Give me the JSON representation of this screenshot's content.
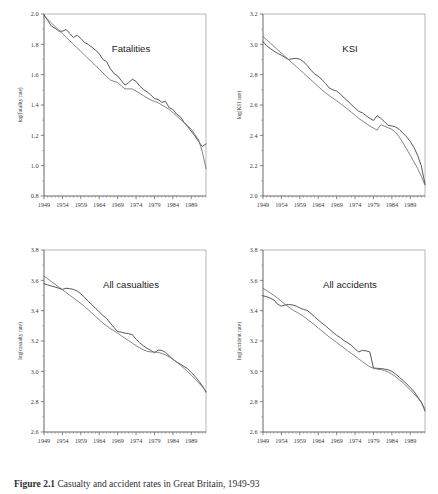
{
  "figure": {
    "caption_label": "Figure",
    "caption_number": "2.1",
    "caption_text": "Casualty and accident rates in Great Britain, 1949-93"
  },
  "chart_data": [
    {
      "type": "line",
      "title": "Fatalities",
      "xlabel": "",
      "ylabel": "log(fatality rate)",
      "xlim": [
        1949,
        1993
      ],
      "ylim": [
        0.8,
        2.0
      ],
      "xticks": [
        1949,
        1954,
        1959,
        1964,
        1969,
        1974,
        1979,
        1984,
        1989
      ],
      "yticks": [
        0.8,
        1.0,
        1.2,
        1.4,
        1.6,
        1.8,
        2.0
      ],
      "grid": false,
      "legend": "none",
      "x": [
        1949,
        1950,
        1951,
        1952,
        1953,
        1954,
        1955,
        1956,
        1957,
        1958,
        1959,
        1960,
        1961,
        1962,
        1963,
        1964,
        1965,
        1966,
        1967,
        1968,
        1969,
        1970,
        1971,
        1972,
        1973,
        1974,
        1975,
        1976,
        1977,
        1978,
        1979,
        1980,
        1981,
        1982,
        1983,
        1984,
        1985,
        1986,
        1987,
        1988,
        1989,
        1990,
        1991,
        1992,
        1993
      ],
      "series": [
        {
          "name": "observed",
          "values": [
            1.995,
            1.958,
            1.92,
            1.906,
            1.888,
            1.886,
            1.898,
            1.872,
            1.845,
            1.86,
            1.839,
            1.812,
            1.8,
            1.781,
            1.762,
            1.738,
            1.7,
            1.686,
            1.64,
            1.608,
            1.592,
            1.561,
            1.531,
            1.548,
            1.57,
            1.556,
            1.525,
            1.502,
            1.487,
            1.466,
            1.443,
            1.436,
            1.418,
            1.424,
            1.382,
            1.371,
            1.34,
            1.323,
            1.287,
            1.258,
            1.227,
            1.196,
            1.158,
            1.127,
            1.143,
            1.104,
            1.058,
            1.022,
            0.975
          ]
        },
        {
          "name": "fitted-trend",
          "values": [
            1.988,
            1.965,
            1.941,
            1.918,
            1.894,
            1.871,
            1.847,
            1.824,
            1.8,
            1.777,
            1.753,
            1.73,
            1.706,
            1.683,
            1.659,
            1.636,
            1.612,
            1.589,
            1.565,
            1.556,
            1.548,
            1.527,
            1.506,
            1.506,
            1.506,
            1.492,
            1.477,
            1.462,
            1.447,
            1.433,
            1.424,
            1.415,
            1.4,
            1.386,
            1.371,
            1.35,
            1.328,
            1.306,
            1.285,
            1.263,
            1.241,
            1.206,
            1.17,
            1.092,
            0.98
          ]
        }
      ]
    },
    {
      "type": "line",
      "title": "KSI",
      "xlabel": "",
      "ylabel": "log(KSI rate)",
      "xlim": [
        1949,
        1993
      ],
      "ylim": [
        2.0,
        3.2
      ],
      "xticks": [
        1949,
        1954,
        1959,
        1964,
        1969,
        1974,
        1979,
        1984,
        1989
      ],
      "yticks": [
        2.0,
        2.2,
        2.4,
        2.6,
        2.8,
        3.0,
        3.2
      ],
      "grid": false,
      "legend": "none",
      "x": [
        1949,
        1950,
        1951,
        1952,
        1953,
        1954,
        1955,
        1956,
        1957,
        1958,
        1959,
        1960,
        1961,
        1962,
        1963,
        1964,
        1965,
        1966,
        1967,
        1968,
        1969,
        1970,
        1971,
        1972,
        1973,
        1974,
        1975,
        1976,
        1977,
        1978,
        1979,
        1980,
        1981,
        1982,
        1983,
        1984,
        1985,
        1986,
        1987,
        1988,
        1989,
        1990,
        1991,
        1992,
        1993
      ],
      "series": [
        {
          "name": "observed",
          "values": [
            3.018,
            2.99,
            2.972,
            2.955,
            2.94,
            2.928,
            2.913,
            2.9,
            2.905,
            2.908,
            2.902,
            2.885,
            2.86,
            2.83,
            2.805,
            2.79,
            2.768,
            2.742,
            2.712,
            2.7,
            2.692,
            2.672,
            2.648,
            2.626,
            2.602,
            2.58,
            2.558,
            2.548,
            2.53,
            2.512,
            2.498,
            2.53,
            2.512,
            2.49,
            2.465,
            2.462,
            2.455,
            2.44,
            2.415,
            2.39,
            2.36,
            2.32,
            2.268,
            2.198,
            2.078
          ]
        },
        {
          "name": "fitted-trend",
          "values": [
            3.052,
            3.03,
            3.008,
            2.986,
            2.964,
            2.942,
            2.92,
            2.898,
            2.876,
            2.854,
            2.832,
            2.81,
            2.788,
            2.766,
            2.744,
            2.722,
            2.7,
            2.68,
            2.662,
            2.645,
            2.628,
            2.61,
            2.592,
            2.572,
            2.552,
            2.532,
            2.512,
            2.495,
            2.478,
            2.462,
            2.448,
            2.434,
            2.47,
            2.46,
            2.45,
            2.44,
            2.42,
            2.39,
            2.352,
            2.31,
            2.268,
            2.225,
            2.182,
            2.13,
            2.072
          ]
        }
      ]
    },
    {
      "type": "line",
      "title": "All casualties",
      "xlabel": "",
      "ylabel": "log(casualty rate)",
      "xlim": [
        1949,
        1993
      ],
      "ylim": [
        2.6,
        3.8
      ],
      "xticks": [
        1949,
        1954,
        1959,
        1964,
        1969,
        1974,
        1979,
        1984,
        1989
      ],
      "yticks": [
        2.6,
        2.8,
        3.0,
        3.2,
        3.4,
        3.6,
        3.8
      ],
      "grid": false,
      "legend": "none",
      "x": [
        1949,
        1950,
        1951,
        1952,
        1953,
        1954,
        1955,
        1956,
        1957,
        1958,
        1959,
        1960,
        1961,
        1962,
        1963,
        1964,
        1965,
        1966,
        1967,
        1968,
        1969,
        1970,
        1971,
        1972,
        1973,
        1974,
        1975,
        1976,
        1977,
        1978,
        1979,
        1980,
        1981,
        1982,
        1983,
        1984,
        1985,
        1986,
        1987,
        1988,
        1989,
        1990,
        1991,
        1992,
        1993
      ],
      "series": [
        {
          "name": "observed",
          "values": [
            3.578,
            3.57,
            3.562,
            3.556,
            3.548,
            3.54,
            3.548,
            3.545,
            3.54,
            3.53,
            3.512,
            3.488,
            3.462,
            3.44,
            3.415,
            3.392,
            3.368,
            3.348,
            3.318,
            3.29,
            3.262,
            3.258,
            3.252,
            3.248,
            3.242,
            3.212,
            3.188,
            3.168,
            3.152,
            3.138,
            3.122,
            3.14,
            3.138,
            3.125,
            3.102,
            3.08,
            3.062,
            3.048,
            3.032,
            3.018,
            2.992,
            2.968,
            2.938,
            2.905,
            2.862
          ]
        },
        {
          "name": "fitted-trend",
          "values": [
            3.628,
            3.61,
            3.592,
            3.574,
            3.556,
            3.538,
            3.52,
            3.502,
            3.484,
            3.466,
            3.448,
            3.428,
            3.406,
            3.384,
            3.362,
            3.34,
            3.318,
            3.3,
            3.282,
            3.268,
            3.252,
            3.235,
            3.218,
            3.202,
            3.186,
            3.17,
            3.155,
            3.142,
            3.132,
            3.128,
            3.128,
            3.125,
            3.118,
            3.108,
            3.095,
            3.08,
            3.062,
            3.042,
            3.02,
            2.998,
            2.975,
            2.95,
            2.925,
            2.898,
            2.868
          ]
        }
      ]
    },
    {
      "type": "line",
      "title": "All accidents",
      "xlabel": "",
      "ylabel": "log(accident rate)",
      "xlim": [
        1949,
        1993
      ],
      "ylim": [
        2.6,
        3.8
      ],
      "xticks": [
        1949,
        1954,
        1959,
        1964,
        1969,
        1974,
        1979,
        1984,
        1989
      ],
      "yticks": [
        2.6,
        2.8,
        3.0,
        3.2,
        3.4,
        3.6,
        3.8
      ],
      "grid": false,
      "legend": "none",
      "x": [
        1949,
        1950,
        1951,
        1952,
        1953,
        1954,
        1955,
        1956,
        1957,
        1958,
        1959,
        1960,
        1961,
        1962,
        1963,
        1964,
        1965,
        1966,
        1967,
        1968,
        1969,
        1970,
        1971,
        1972,
        1973,
        1974,
        1975,
        1976,
        1977,
        1978,
        1979,
        1980,
        1981,
        1982,
        1983,
        1984,
        1985,
        1986,
        1987,
        1988,
        1989,
        1990,
        1991,
        1992,
        1993
      ],
      "series": [
        {
          "name": "observed",
          "values": [
            3.498,
            3.492,
            3.482,
            3.47,
            3.442,
            3.43,
            3.438,
            3.44,
            3.438,
            3.43,
            3.418,
            3.408,
            3.402,
            3.382,
            3.36,
            3.338,
            3.318,
            3.3,
            3.278,
            3.258,
            3.238,
            3.222,
            3.202,
            3.188,
            3.172,
            3.148,
            3.128,
            3.138,
            3.135,
            3.128,
            3.022,
            3.02,
            3.018,
            3.015,
            3.01,
            3.0,
            2.982,
            2.962,
            2.94,
            2.918,
            2.892,
            2.868,
            2.832,
            2.798,
            2.738
          ]
        },
        {
          "name": "fitted-trend",
          "values": [
            3.548,
            3.532,
            3.516,
            3.5,
            3.482,
            3.462,
            3.442,
            3.424,
            3.406,
            3.392,
            3.378,
            3.362,
            3.344,
            3.326,
            3.306,
            3.286,
            3.266,
            3.246,
            3.226,
            3.208,
            3.19,
            3.172,
            3.154,
            3.136,
            3.118,
            3.1,
            3.082,
            3.064,
            3.046,
            3.03,
            3.02,
            3.015,
            3.012,
            3.005,
            2.995,
            2.982,
            2.965,
            2.945,
            2.925,
            2.902,
            2.878,
            2.852,
            2.825,
            2.795,
            2.752
          ]
        }
      ]
    }
  ]
}
